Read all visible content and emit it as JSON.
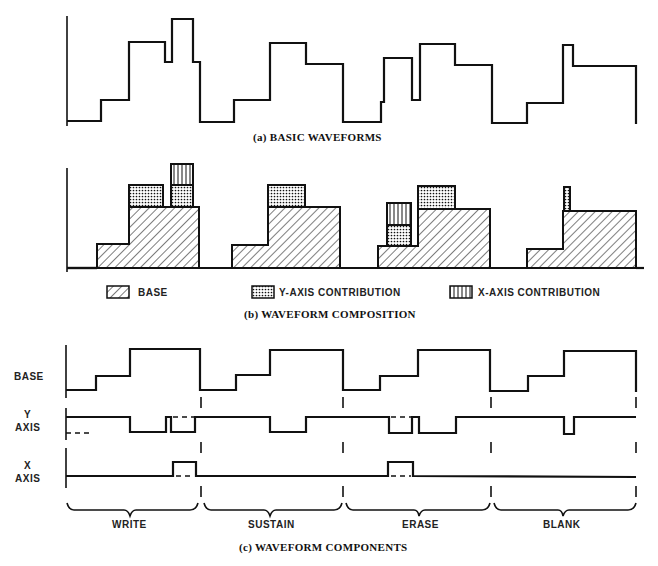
{
  "figure": {
    "panel_a": {
      "caption": "(a) BASIC WAVEFORMS"
    },
    "panel_b": {
      "caption": "(b) WAVEFORM COMPOSITION",
      "legend": [
        {
          "key": "base",
          "label": "BASE",
          "pattern": "diagonal-hatch"
        },
        {
          "key": "y",
          "label": "Y-AXIS CONTRIBUTION",
          "pattern": "dot-stipple"
        },
        {
          "key": "x",
          "label": "X-AXIS CONTRIBUTION",
          "pattern": "vertical-lines"
        }
      ]
    },
    "panel_c": {
      "caption": "(c) WAVEFORM COMPONENTS",
      "row_labels": {
        "base": "BASE",
        "y_line1": "Y",
        "y_line2": "AXIS",
        "x_line1": "X",
        "x_line2": "AXIS"
      },
      "phases": [
        "WRITE",
        "SUSTAIN",
        "ERASE",
        "BLANK"
      ]
    }
  },
  "colors": {
    "ink": "#111111",
    "paper": "#ffffff"
  }
}
